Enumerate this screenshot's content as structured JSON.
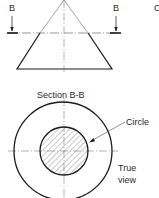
{
  "elevation": {
    "name": "cone-elevation",
    "section_label_left": "B",
    "section_label_right": "B",
    "partial_label_right": "C"
  },
  "section": {
    "title": "Section B-B",
    "callout_circle": "Circle",
    "callout_true_view_line1": "True",
    "callout_true_view_line2": "view"
  },
  "colors": {
    "line": "#1a1a1a",
    "thin_line": "#555555",
    "hatch": "#666666",
    "background": "#ffffff"
  }
}
